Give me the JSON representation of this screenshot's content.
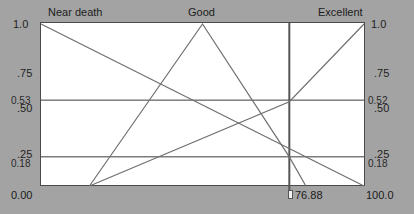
{
  "panel": {
    "background_color": "#a3a3a3",
    "plot_background_color": "#ffffff",
    "line_color": "#6b6b6b",
    "axis_color": "#3c3c3c",
    "cursor_color": "#555555"
  },
  "top_labels": [
    {
      "text": "Near death",
      "x_value": 0
    },
    {
      "text": "Good",
      "x_value": 50
    },
    {
      "text": "Excellent",
      "x_value": 100
    }
  ],
  "left_axis": {
    "ticks": [
      "1.0",
      ".75",
      ".50",
      ".25"
    ],
    "value_markers": [
      "0.53",
      "0.18"
    ],
    "origin_label": "0.00"
  },
  "right_axis": {
    "ticks": [
      "1.0",
      ".75",
      ".50",
      ".25"
    ],
    "value_markers": [
      "0.52",
      "0.18"
    ],
    "max_label": "100.0"
  },
  "cursor": {
    "readout": "76.88",
    "x_value": 76.88
  },
  "chart_data": {
    "type": "line",
    "title": "",
    "subtitle": "",
    "xlabel": "",
    "ylabel": "",
    "xlim": [
      0,
      100
    ],
    "ylim": [
      0,
      1.0
    ],
    "grid": false,
    "legend": "top-inline",
    "x_tick_labels": [
      "0.00",
      "100.0"
    ],
    "y_tick_labels": [
      "0.00",
      ".25",
      ".50",
      ".75",
      "1.0"
    ],
    "y_ticks": [
      0,
      0.25,
      0.5,
      0.75,
      1.0
    ],
    "reference_lines": [
      {
        "orientation": "horizontal",
        "value": 0.53,
        "label_left": "0.53",
        "label_right": "0.52"
      },
      {
        "orientation": "horizontal",
        "value": 0.18,
        "label_left": "0.18",
        "label_right": "0.18"
      },
      {
        "orientation": "vertical",
        "value": 76.88,
        "label": "76.88"
      }
    ],
    "annotations": [
      {
        "text": "0.53",
        "x": 0,
        "y": 0.53
      },
      {
        "text": "0.18",
        "x": 0,
        "y": 0.18
      },
      {
        "text": "0.52",
        "x": 100,
        "y": 0.52
      },
      {
        "text": "0.18",
        "x": 100,
        "y": 0.18
      },
      {
        "text": "76.88",
        "x": 76.88,
        "y": 0
      }
    ],
    "series": [
      {
        "name": "Near death",
        "points": [
          [
            0,
            1.0
          ],
          [
            100,
            0.0
          ]
        ]
      },
      {
        "name": "Good",
        "points": [
          [
            15,
            0.0
          ],
          [
            50,
            1.0
          ],
          [
            76.88,
            0.18
          ],
          [
            82,
            0.0
          ]
        ]
      },
      {
        "name": "Excellent",
        "points": [
          [
            15,
            0.0
          ],
          [
            76.88,
            0.52
          ],
          [
            100,
            1.0
          ]
        ]
      }
    ]
  }
}
